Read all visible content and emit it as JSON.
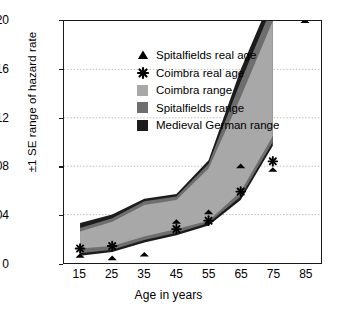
{
  "chart_data": {
    "type": "area",
    "title": "",
    "xlabel": "Age in years",
    "ylabel": "±1 SE range of hazard rate",
    "xlim": [
      10,
      90
    ],
    "ylim": [
      0,
      0.2
    ],
    "grid": "horizontal-dotted",
    "legend_position": "top-left-inside",
    "x_ticks": [
      15,
      25,
      35,
      45,
      55,
      65,
      75,
      85
    ],
    "x_tick_labels": [
      "15",
      "25",
      "35",
      "45",
      "55",
      "65",
      "75",
      "85"
    ],
    "y_ticks": [
      0,
      0.04,
      0.08,
      0.12,
      0.16,
      0.2
    ],
    "y_tick_labels": [
      "0",
      "0.04",
      "0.08",
      "0.12",
      "0.16",
      "0.20"
    ],
    "bands": [
      {
        "name": "Coimbra range",
        "color": "#a8a8a8",
        "x": [
          15,
          25,
          35,
          45,
          55,
          65,
          75
        ],
        "lower": [
          0.012,
          0.014,
          0.022,
          0.028,
          0.035,
          0.059,
          0.105
        ],
        "upper": [
          0.026,
          0.034,
          0.048,
          0.052,
          0.078,
          0.137,
          0.2
        ]
      },
      {
        "name": "Spitalfields range",
        "color": "#6e6e6e",
        "x": [
          15,
          25,
          35,
          45,
          55,
          65,
          75
        ],
        "lower": [
          0.008,
          0.011,
          0.019,
          0.025,
          0.033,
          0.055,
          0.1
        ],
        "upper": [
          0.029,
          0.037,
          0.051,
          0.055,
          0.082,
          0.15,
          0.213
        ]
      },
      {
        "name": "Medieval German range",
        "color": "#1c1c1c",
        "x": [
          15,
          25,
          35,
          45,
          55,
          65,
          75
        ],
        "lower": [
          0.006,
          0.009,
          0.017,
          0.023,
          0.031,
          0.052,
          0.097
        ],
        "upper": [
          0.033,
          0.04,
          0.053,
          0.057,
          0.085,
          0.16,
          0.222
        ]
      }
    ],
    "series": [
      {
        "name": "Spitalfields real age",
        "marker": "triangle",
        "color": "#000000",
        "x": [
          15,
          25,
          35,
          45,
          55,
          65,
          75,
          85
        ],
        "values": [
          0.006,
          0.004,
          0.007,
          0.034,
          0.042,
          0.08,
          0.077,
          0.2
        ]
      },
      {
        "name": "Coimbra real age",
        "marker": "asterisk",
        "color": "#000000",
        "x": [
          15,
          25,
          45,
          55,
          65,
          75
        ],
        "values": [
          0.012,
          0.014,
          0.028,
          0.035,
          0.059,
          0.084
        ]
      }
    ]
  },
  "legend": {
    "items": [
      {
        "label": "Spitalfields real age",
        "key": "triangle-marker-icon",
        "color": "#000000"
      },
      {
        "label": "Coimbra real age",
        "key": "asterisk-marker-icon",
        "color": "#000000"
      },
      {
        "label": "Coimbra range",
        "key": "swatch",
        "color": "#a8a8a8"
      },
      {
        "label": "Spitalfields range",
        "key": "swatch",
        "color": "#6e6e6e"
      },
      {
        "label": "Medieval German range",
        "key": "swatch",
        "color": "#1c1c1c"
      }
    ]
  }
}
